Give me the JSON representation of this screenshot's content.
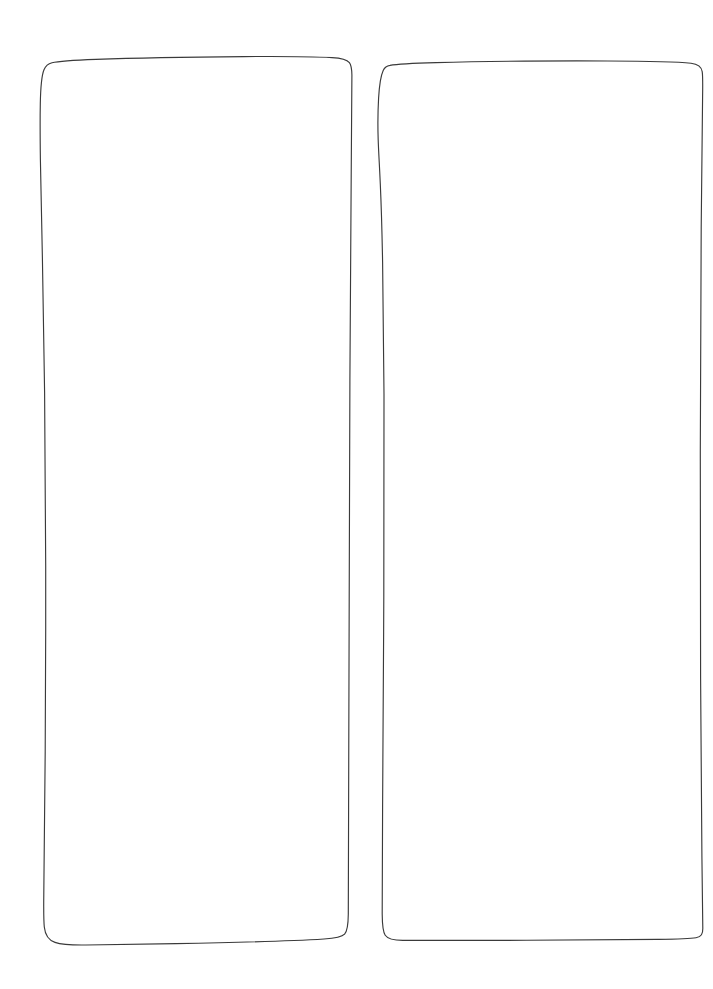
{
  "canvas": {
    "width": 713,
    "height": 989,
    "background_color": "#ffffff",
    "style": "hand-drawn-sketch-wireframe"
  },
  "stroke": {
    "color": "#3a3a3a",
    "width_px": 1,
    "style": "hand-drawn"
  },
  "panels": [
    {
      "id": "panel-left",
      "label": "",
      "content": "",
      "filled": false,
      "corner_style": "rounded",
      "bounds": {
        "x": 40,
        "y": 60,
        "width": 312,
        "height": 886
      }
    },
    {
      "id": "panel-right",
      "label": "",
      "content": "",
      "filled": false,
      "corner_style": "rounded",
      "bounds": {
        "x": 377,
        "y": 63,
        "width": 326,
        "height": 878
      }
    }
  ]
}
